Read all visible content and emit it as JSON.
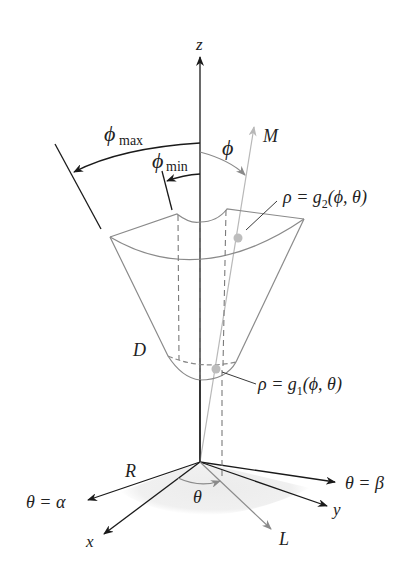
{
  "figure": {
    "colors": {
      "axis": "#1a1a1a",
      "surface_outline": "#8a8a8a",
      "ray_gray": "#b0b0b0",
      "point": "#bdbdbd",
      "shadow": "#efefef"
    }
  },
  "labels": {
    "z_axis": "z",
    "x_axis": "x",
    "y_axis": "y",
    "phi_max": "ϕ",
    "phi_max_sub": "max",
    "phi_min": "ϕ",
    "phi_min_sub": "min",
    "phi": "ϕ",
    "ray_M": "M",
    "ray_L": "L",
    "ray_R": "R",
    "region_D": "D",
    "theta": "θ",
    "theta_alpha": "θ = α",
    "theta_beta": "θ = β",
    "outer_surface": {
      "rho": "ρ = g",
      "sub": "2",
      "args": "(ϕ, θ)"
    },
    "inner_surface": {
      "rho": "ρ = g",
      "sub": "1",
      "args": "(ϕ, θ)"
    }
  }
}
